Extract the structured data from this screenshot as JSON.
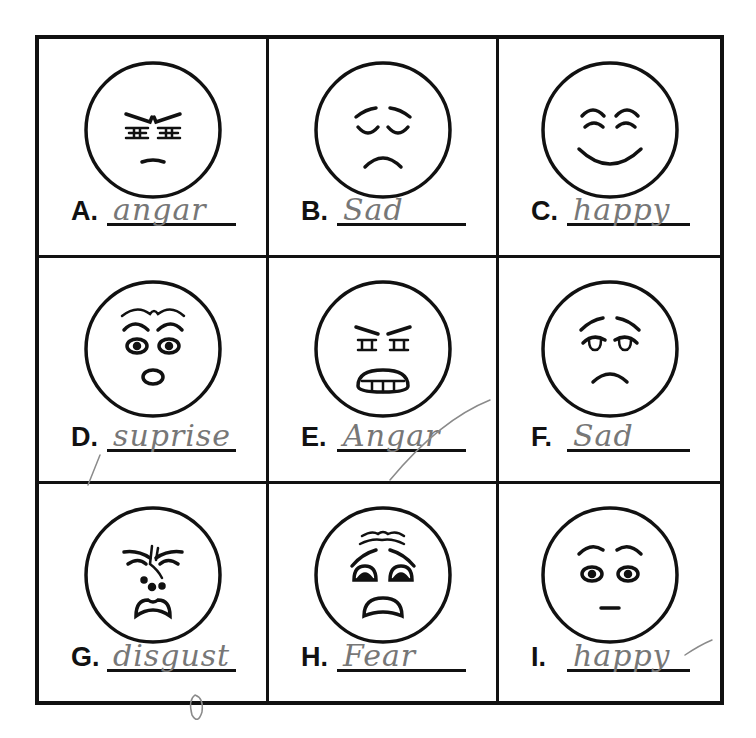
{
  "worksheet": {
    "title": "Emotion faces worksheet",
    "layout": {
      "rows": 3,
      "columns": 3
    },
    "colors": {
      "ink": "#111111",
      "pencil": "#777777",
      "paper": "#ffffff"
    },
    "items": [
      {
        "letter": "A.",
        "expression": "angry-face",
        "answer": "angar"
      },
      {
        "letter": "B.",
        "expression": "sad-closed-eyes-face",
        "answer": "Sad"
      },
      {
        "letter": "C.",
        "expression": "happy-face",
        "answer": "happy"
      },
      {
        "letter": "D.",
        "expression": "surprised-face",
        "answer": "suprise"
      },
      {
        "letter": "E.",
        "expression": "angry-teeth-face",
        "answer": "Angar"
      },
      {
        "letter": "F.",
        "expression": "sad-face",
        "answer": "Sad"
      },
      {
        "letter": "G.",
        "expression": "disgusted-face",
        "answer": "disgust"
      },
      {
        "letter": "H.",
        "expression": "fearful-face",
        "answer": "Fear"
      },
      {
        "letter": "I.",
        "expression": "neutral-wide-eyes-face",
        "answer": "happy"
      }
    ]
  }
}
